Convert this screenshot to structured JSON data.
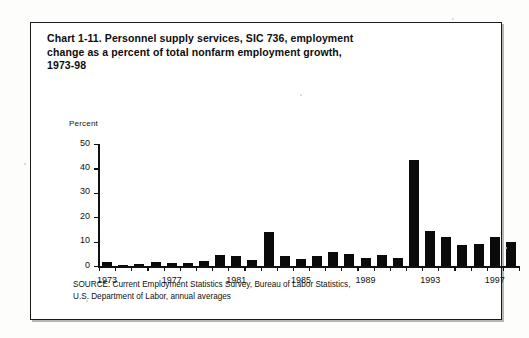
{
  "figure": {
    "title_prefix": "Chart 1-11. ",
    "title": "Personnel supply services, SIC 736, employment change as a percent of total nonfarm employment growth, 1973-98",
    "title_line1": "Chart 1-11. Personnel supply services, SIC 736, employment",
    "title_line2": "change as a percent of total nonfarm employment growth,",
    "title_line3": "1973-98",
    "axis_unit_label": "Percent",
    "source_line1": "SOURCE: Current Employment Statistics Survey, Bureau of Labor Statistics,",
    "source_line2": "U.S. Department of Labor, annual averages"
  },
  "chart_data": {
    "type": "bar",
    "title": "Chart 1-11. Personnel supply services, SIC 736, employment change as a percent of total nonfarm employment growth, 1973-98",
    "xlabel": "",
    "ylabel": "Percent",
    "ylim": [
      0,
      50
    ],
    "ytick_labels": [
      "0",
      "10",
      "20",
      "30",
      "40",
      "50"
    ],
    "yticks": [
      0,
      10,
      20,
      30,
      40,
      50
    ],
    "xtick_labels": [
      "1973",
      "1977",
      "1981",
      "1985",
      "1989",
      "1993",
      "1997"
    ],
    "xticks": [
      1973,
      1977,
      1981,
      1985,
      1989,
      1993,
      1997
    ],
    "grid": false,
    "legend": false,
    "bar_color": "#0a0a0a",
    "categories": [
      "1973",
      "1974",
      "1975",
      "1976",
      "1977",
      "1978",
      "1979",
      "1980",
      "1981",
      "1982",
      "1983",
      "1984",
      "1985",
      "1986",
      "1987",
      "1988",
      "1989",
      "1990",
      "1991",
      "1992",
      "1993",
      "1994",
      "1995",
      "1996",
      "1997",
      "1998"
    ],
    "values": [
      1.5,
      0.4,
      1.0,
      1.6,
      1.2,
      1.3,
      2.0,
      4.5,
      4.3,
      2.3,
      13.8,
      4.0,
      2.7,
      4.2,
      5.8,
      4.8,
      3.4,
      4.6,
      3.2,
      43.5,
      14.5,
      11.8,
      8.5,
      9.0,
      12.0,
      9.8
    ]
  }
}
